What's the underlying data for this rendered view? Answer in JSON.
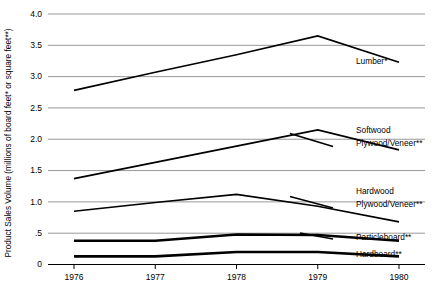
{
  "chart_data": {
    "type": "line",
    "title": "",
    "xlabel": "",
    "ylabel": "Product Sales Volume (millions of board feet* or square feet**)",
    "categories": [
      "1976",
      "1977",
      "1978",
      "1979",
      "1980"
    ],
    "x": [
      1976,
      1977,
      1978,
      1979,
      1980
    ],
    "xlim": [
      1975.68,
      1980.32
    ],
    "ylim": [
      0,
      4.0
    ],
    "yticks": [
      "0",
      ".5",
      "1.0",
      "1.5",
      "2.0",
      "2.5",
      "3.0",
      "3.5",
      "4.0"
    ],
    "ytick_values": [
      0,
      0.5,
      1.0,
      1.5,
      2.0,
      2.5,
      3.0,
      3.5,
      4.0
    ],
    "grid": true,
    "grid_orientation": "horizontal",
    "legend_position": "right-inline",
    "series": [
      {
        "name": "Lumber*",
        "label_lines": [
          "Lumber*"
        ],
        "values": [
          2.78,
          3.07,
          3.35,
          3.65,
          3.23
        ],
        "weight": "thin"
      },
      {
        "name": "Softwood Plywood/Veneer**",
        "label_lines": [
          "Softwood",
          "Plywood/Veneer**"
        ],
        "values": [
          1.37,
          1.63,
          1.89,
          2.15,
          1.83
        ],
        "weight": "thin"
      },
      {
        "name": "Hardwood Plywood/Veneer**",
        "label_lines": [
          "Hardwood",
          "Plywood/Veneer**"
        ],
        "values": [
          0.85,
          0.99,
          1.12,
          0.93,
          0.68
        ],
        "weight": "thin"
      },
      {
        "name": "Particleboard**",
        "label_lines": [
          "Particleboard**"
        ],
        "values": [
          0.38,
          0.38,
          0.48,
          0.47,
          0.38
        ],
        "weight": "thick"
      },
      {
        "name": "Hardboard**",
        "label_lines": [
          "Hardboard**"
        ],
        "values": [
          0.13,
          0.13,
          0.2,
          0.2,
          0.13
        ],
        "weight": "thick"
      }
    ]
  },
  "axes": {
    "y_title": "Product Sales Volume (millions of board feet* or square feet**)",
    "y_ticks": [
      {
        "label": "4.0",
        "value": 4.0
      },
      {
        "label": "3.5",
        "value": 3.5
      },
      {
        "label": "3.0",
        "value": 3.0
      },
      {
        "label": "2.5",
        "value": 2.5
      },
      {
        "label": "2.0",
        "value": 2.0
      },
      {
        "label": "1.5",
        "value": 1.5
      },
      {
        "label": "1.0",
        "value": 1.0
      },
      {
        "label": ".5",
        "value": 0.5
      },
      {
        "label": "0",
        "value": 0.0
      }
    ],
    "x_ticks": [
      {
        "label": "1976",
        "value": 1976
      },
      {
        "label": "1977",
        "value": 1977
      },
      {
        "label": "1978",
        "value": 1978
      },
      {
        "label": "1979",
        "value": 1979
      },
      {
        "label": "1980",
        "value": 1980
      }
    ]
  },
  "series_labels": [
    {
      "id": "lumber",
      "lines": [
        "Lumber*"
      ]
    },
    {
      "id": "softwood-plywood",
      "lines": [
        "Softwood",
        "Plywood/Veneer**"
      ]
    },
    {
      "id": "hardwood-plywood",
      "lines": [
        "Hardwood",
        "Plywood/Veneer**"
      ]
    },
    {
      "id": "particleboard",
      "lines": [
        "Particleboard**"
      ]
    },
    {
      "id": "hardboard",
      "lines": [
        "Hardboard**"
      ]
    }
  ],
  "colors": {
    "line": "#000000",
    "grid": "#8c8c8c",
    "axis": "#000000",
    "background": "#ffffff"
  }
}
